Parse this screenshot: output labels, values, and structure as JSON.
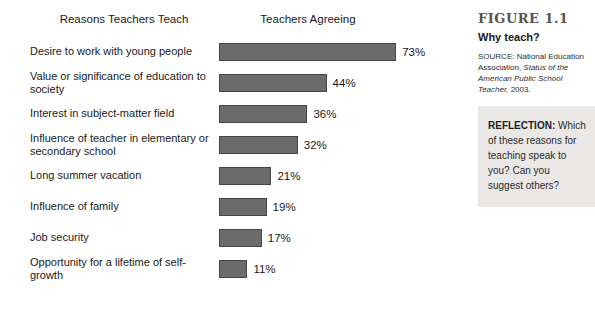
{
  "chart_data": {
    "type": "bar",
    "orientation": "horizontal",
    "title_left": "Reasons Teachers Teach",
    "title_right": "Teachers Agreeing",
    "categories": [
      "Desire to work with young people",
      "Value or significance of education to society",
      "Interest in subject-matter field",
      "Influence of teacher in elementary or secondary school",
      "Long summer vacation",
      "Influence of family",
      "Job security",
      "Opportunity for a lifetime of self-growth"
    ],
    "values": [
      73,
      44,
      36,
      32,
      21,
      19,
      17,
      11
    ],
    "value_suffix": "%",
    "xlim": [
      0,
      80
    ],
    "px_per_percent": 2.4,
    "bar_color": "#6b6b6b",
    "bar_border_color": "#454545",
    "grid": false,
    "legend": "none"
  },
  "figure": {
    "label": "FIGURE 1.1",
    "title": "Why teach?",
    "source_prefix": "SOURCE: National Education Association, ",
    "source_italic": "Status of the American Public School Teacher,",
    "source_suffix": " 2003."
  },
  "reflection": {
    "label": "REFLECTION:",
    "text": " Which of these reasons for teaching speak to you? Can you suggest others?"
  },
  "colors": {
    "background": "#ffffff",
    "bar_fill": "#6b6b6b",
    "bar_border": "#454545",
    "reflection_bg": "#e9e8e6",
    "figure_label": "#5a524a",
    "text": "#1a1a1a"
  }
}
